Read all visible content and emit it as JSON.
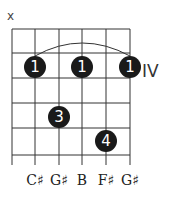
{
  "chord": {
    "position_label": "IV",
    "muted_marker": "x",
    "strings": [
      "",
      "C♯",
      "G♯",
      "B",
      "F♯",
      "G♯"
    ],
    "fingers": [
      {
        "string": 2,
        "fret": 1,
        "finger": "1"
      },
      {
        "string": 4,
        "fret": 1,
        "finger": "1"
      },
      {
        "string": 6,
        "fret": 1,
        "finger": "1"
      },
      {
        "string": 3,
        "fret": 3,
        "finger": "3"
      },
      {
        "string": 5,
        "fret": 4,
        "finger": "4"
      }
    ],
    "barre": {
      "from_string": 2,
      "to_string": 6,
      "fret": 1
    },
    "colors": {
      "dot": "#1a1a1a",
      "grid": "#333333",
      "text": "#222222"
    }
  }
}
